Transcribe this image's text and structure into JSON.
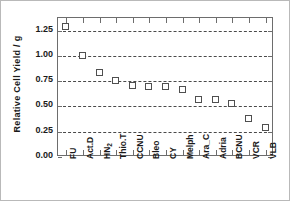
{
  "chart_data": {
    "type": "scatter",
    "title": "",
    "xlabel": "",
    "ylabel": "Relative Cell Yield  /  g",
    "ylim": [
      0.0,
      1.375
    ],
    "yticks": [
      "0.00",
      "0.25",
      "0.50",
      "0.75",
      "1.00",
      "1.25"
    ],
    "ytick_values": [
      0.0,
      0.25,
      0.5,
      0.75,
      1.0,
      1.25
    ],
    "grid": "horizontal-dashed",
    "legend": "none",
    "marker": "open-square",
    "categories": [
      "FU",
      "Act.D",
      "HN2",
      "Thio.T",
      "CCNU",
      "Bleo",
      "CY",
      "Melph",
      "Ara_C",
      "Adria",
      "BCNU",
      "VCR",
      "VLB"
    ],
    "category_labels_html": [
      "FU",
      "Act.D",
      "HN<sub>2</sub>",
      "Thio.T",
      "CCNU",
      "Bleo",
      "CY",
      "Melph",
      "Ara_C",
      "Adria",
      "BCNU",
      "VCR",
      "VLB"
    ],
    "values": [
      1.29,
      1.0,
      0.83,
      0.755,
      0.7,
      0.69,
      0.69,
      0.66,
      0.565,
      0.56,
      0.525,
      0.38,
      0.29
    ]
  },
  "colors": {
    "marker_edge": "#4f4f4f",
    "marker_face": "#ffffff",
    "axis": "#6d6d6d",
    "grid": "#4a4a4a",
    "text": "#1a1a1a",
    "background": "#ffffff",
    "image_border": "#b9b9b9"
  },
  "axis_label_names": {
    "y_axis_title": "Relative Cell Yield  /  g"
  }
}
